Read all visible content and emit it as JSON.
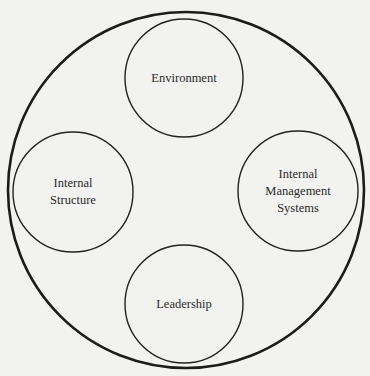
{
  "diagram": {
    "type": "nested-circles",
    "outer": {
      "cx": 186,
      "cy": 190,
      "r": 178,
      "stroke": "#1c1c1c",
      "stroke_width": 2.6
    },
    "background": "#f2f2f0",
    "nodes": [
      {
        "id": "environment",
        "lines": [
          "Environment"
        ],
        "cx": 184,
        "cy": 78,
        "r": 59
      },
      {
        "id": "internal-structure",
        "lines": [
          "Internal",
          "Structure"
        ],
        "cx": 73,
        "cy": 192,
        "r": 60
      },
      {
        "id": "internal-management-systems",
        "lines": [
          "Internal",
          "Management",
          "Systems"
        ],
        "cx": 298,
        "cy": 191,
        "r": 60
      },
      {
        "id": "leadership",
        "lines": [
          "Leadership"
        ],
        "cx": 184,
        "cy": 304,
        "r": 59
      }
    ],
    "inner_stroke": "#222222",
    "inner_stroke_width": 1.4
  }
}
